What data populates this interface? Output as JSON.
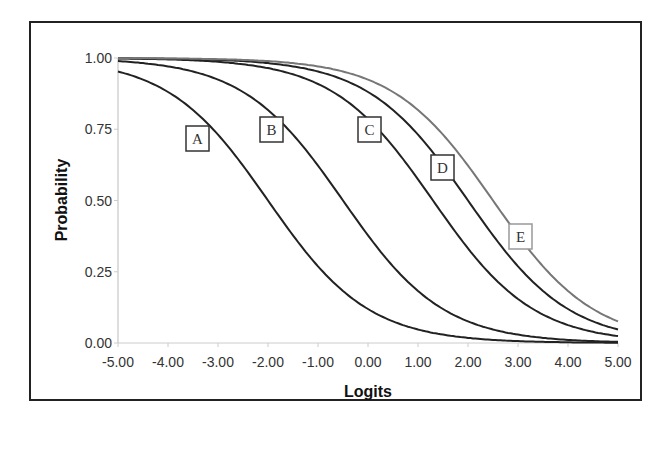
{
  "chart_data": {
    "type": "line",
    "title": "",
    "xlabel": "Logits",
    "ylabel": "Probability",
    "xlim": [
      -5,
      5
    ],
    "ylim": [
      0,
      1
    ],
    "grid": false,
    "legend": "inline boxed labels on curves",
    "x_ticks": [
      "-5.00",
      "-4.00",
      "-3.00",
      "-2.00",
      "-1.00",
      "0.00",
      "1.00",
      "2.00",
      "3.00",
      "4.00",
      "5.00"
    ],
    "y_ticks": [
      "0.00",
      "0.25",
      "0.50",
      "0.75",
      "1.00"
    ],
    "x": [
      -5,
      -4,
      -3,
      -2,
      -1,
      0,
      1,
      2,
      3,
      4,
      5
    ],
    "series": [
      {
        "name": "A",
        "midpoint": -2.0,
        "color": "#222222",
        "label_pos": [
          186,
          126
        ],
        "values": [
          0.95,
          0.88,
          0.73,
          0.5,
          0.27,
          0.12,
          0.05,
          0.02,
          0.01,
          0.0,
          0.0
        ]
      },
      {
        "name": "B",
        "midpoint": -0.5,
        "color": "#222222",
        "label_pos": [
          260,
          117
        ],
        "values": [
          0.99,
          0.97,
          0.92,
          0.82,
          0.62,
          0.38,
          0.18,
          0.08,
          0.03,
          0.01,
          0.01
        ]
      },
      {
        "name": "C",
        "midpoint": 1.3,
        "color": "#222222",
        "label_pos": [
          358,
          117
        ],
        "values": [
          1.0,
          1.0,
          0.99,
          0.96,
          0.91,
          0.79,
          0.57,
          0.33,
          0.15,
          0.06,
          0.02
        ]
      },
      {
        "name": "D",
        "midpoint": 2.0,
        "color": "#222222",
        "label_pos": [
          431,
          155
        ],
        "values": [
          1.0,
          1.0,
          0.99,
          0.98,
          0.95,
          0.88,
          0.73,
          0.5,
          0.27,
          0.12,
          0.05
        ]
      },
      {
        "name": "E",
        "midpoint": 2.5,
        "color": "#777777",
        "label_pos": [
          509,
          224
        ],
        "values": [
          1.0,
          1.0,
          1.0,
          0.99,
          0.97,
          0.92,
          0.82,
          0.62,
          0.38,
          0.18,
          0.08
        ]
      }
    ]
  }
}
